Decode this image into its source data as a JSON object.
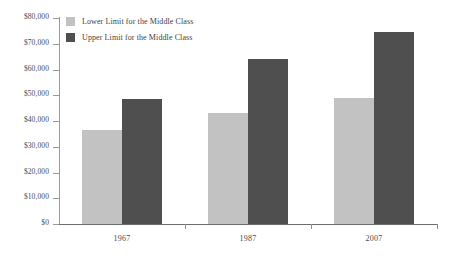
{
  "chart_data": {
    "type": "bar",
    "title": "",
    "subtitle": "",
    "xlabel": "",
    "ylabel": "",
    "categories": [
      "1967",
      "1987",
      "2007"
    ],
    "series": [
      {
        "name": "Lower Limit for the Middle Class",
        "color": "#c2c2c2",
        "values": [
          36400,
          43200,
          49000
        ]
      },
      {
        "name": "Upper Limit for the Middle Class",
        "color": "#4f4f4f",
        "values": [
          48700,
          64100,
          74500
        ]
      }
    ],
    "ylim": [
      0,
      80000
    ],
    "ytick_values": [
      0,
      10000,
      20000,
      30000,
      40000,
      50000,
      60000,
      70000,
      80000
    ],
    "ytick_labels": [
      "$0",
      "$10,000",
      "$20,000",
      "$30,000",
      "$40,000",
      "$50,000",
      "$60,000",
      "$70,000",
      "$80,000"
    ],
    "grid": false,
    "legend_position": "top-left",
    "axis_color": "#8e8e8e",
    "background": "#ffffff"
  },
  "legend": {
    "items": [
      {
        "label": "Lower Limit for the Middle Class",
        "swatch": "lower"
      },
      {
        "label": "Upper Limit for the Middle Class",
        "swatch": "upper"
      }
    ]
  }
}
